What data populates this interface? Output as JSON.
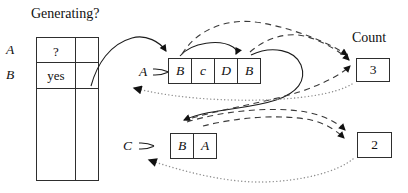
{
  "title": "Generating?",
  "table": {
    "rows": [
      {
        "label": "A",
        "value": "?"
      },
      {
        "label": "B",
        "value": "yes"
      }
    ]
  },
  "rules": [
    {
      "name": "A",
      "symbols": [
        "B",
        "c",
        "D",
        "B"
      ]
    },
    {
      "name": "C",
      "symbols": [
        "B",
        "A"
      ]
    }
  ],
  "counts": {
    "label": "Count",
    "boxes": [
      "3",
      "2"
    ]
  },
  "colors": {
    "ink": "#111111",
    "line": "#1c1c1c",
    "dash": "#3a3a3a",
    "dot": "#8f8f8f",
    "background": "#ffffff"
  }
}
